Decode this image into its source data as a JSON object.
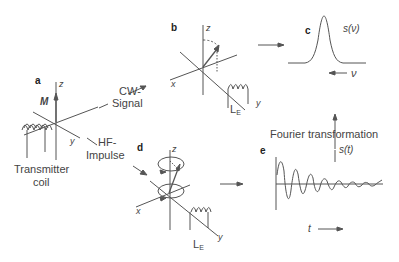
{
  "panels": {
    "a": {
      "label": "a",
      "vector_label": "M",
      "axis_z": "z",
      "axis_y": "y",
      "coil_label_line1": "Transmitter",
      "coil_label_line2": "coil"
    },
    "b": {
      "label": "b",
      "axis_z": "z",
      "axis_x": "x",
      "axis_y": "y",
      "coil_label": "L",
      "coil_subscript": "E"
    },
    "c": {
      "label": "c",
      "signal_label": "s(ν)",
      "axis_label": "ν"
    },
    "d": {
      "label": "d",
      "axis_z": "z",
      "axis_x": "x",
      "axis_y": "y",
      "coil_label": "L",
      "coil_subscript": "E"
    },
    "e": {
      "label": "e",
      "signal_label": "s(t)",
      "axis_label": "t"
    }
  },
  "arrows": {
    "cw_line1": "CW-",
    "cw_line2": "Signal",
    "hf_line1": "HF-",
    "hf_line2": "Impulse",
    "fourier": "Fourier transformation"
  },
  "colors": {
    "line": "#555555",
    "text": "#444444"
  }
}
